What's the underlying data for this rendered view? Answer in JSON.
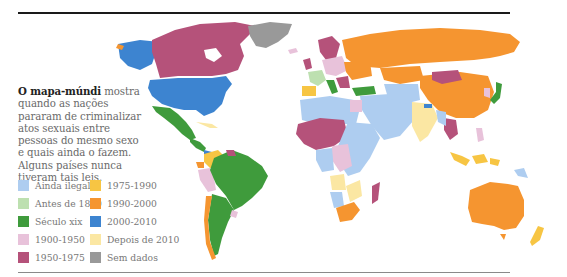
{
  "caption": {
    "bold": "O mapa-múndi",
    "text": " mostra quando as nações pararam de criminalizar atos sexuais entre pessoas do mesmo sexo e quais ainda o fazem. Alguns países nunca tiveram tais leis."
  },
  "legend": [
    {
      "label": "Ainda ilegal",
      "color": "#aecdf0"
    },
    {
      "label": "1975-1990",
      "color": "#f7c543"
    },
    {
      "label": "Antes de 1800",
      "color": "#bde0b0"
    },
    {
      "label": "1990-2000",
      "color": "#f59530"
    },
    {
      "label": "Século xix",
      "color": "#3f9b3c"
    },
    {
      "label": "2000-2010",
      "color": "#3d84d0"
    },
    {
      "label": "1900-1950",
      "color": "#e8c2da"
    },
    {
      "label": "Depois de 2010",
      "color": "#fbe7a3"
    },
    {
      "label": "1950-1975",
      "color": "#b5527a"
    },
    {
      "label": "Sem dados",
      "color": "#999999"
    }
  ],
  "colors": {
    "still_illegal": "#aecdf0",
    "before_1800": "#bde0b0",
    "century_19": "#3f9b3c",
    "y1900_1950": "#e8c2da",
    "y1950_1975": "#b5527a",
    "y1975_1990": "#f7c543",
    "y1990_2000": "#f59530",
    "y2000_2010": "#3d84d0",
    "after_2010": "#fbe7a3",
    "no_data": "#999999"
  }
}
